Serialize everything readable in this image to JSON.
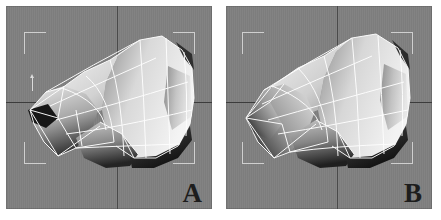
{
  "document": {
    "type": "figure",
    "caption_labels": [
      "A",
      "B"
    ],
    "background_color": "#ffffff"
  },
  "theme": {
    "viewport_background": "#808080",
    "wireframe_color": "#ffffff",
    "selection_bracket_color": "#cfcfcf",
    "crosshair_vertical_color": "#4a4a4a",
    "crosshair_horizontal_color": "#3c3c3c",
    "label_color": "#1d1d1d",
    "mesh_highlight": "#f2f2f2",
    "mesh_shadow": "#2b2b2b"
  },
  "panels": [
    {
      "id": "panel-a",
      "label": "A",
      "viewport_name": "perspective-viewport-a",
      "has_axis_gizmo": true,
      "has_pivot_marker": true,
      "selection_bracket": {
        "left": 18,
        "top": 26,
        "width": 171,
        "height": 132,
        "tick": 22
      },
      "crosshair": {
        "x": 111,
        "y": 96
      }
    },
    {
      "id": "panel-b",
      "label": "B",
      "viewport_name": "perspective-viewport-b",
      "has_axis_gizmo": false,
      "has_pivot_marker": false,
      "selection_bracket": {
        "left": 16,
        "top": 26,
        "width": 171,
        "height": 132,
        "tick": 22
      },
      "crosshair": {
        "x": 111,
        "y": 96
      }
    }
  ]
}
